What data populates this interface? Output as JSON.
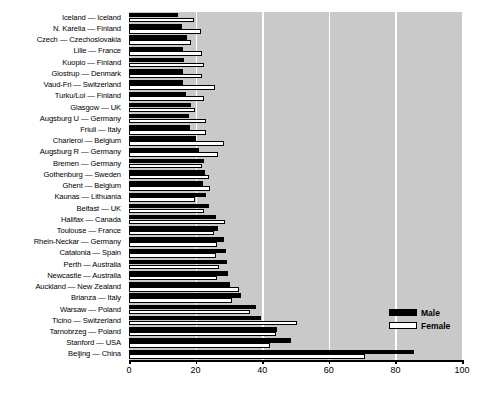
{
  "chart_data": {
    "type": "bar",
    "orientation": "horizontal",
    "title": "",
    "subtitle": "",
    "xlabel": "",
    "ylabel": "",
    "xlim": [
      0,
      100
    ],
    "xticks": [
      0,
      20,
      40,
      60,
      80,
      100
    ],
    "xtick_labels": [
      "0",
      "20",
      "40",
      "60",
      "80",
      "100"
    ],
    "grid": "vertical white gridlines at 20, 40, 60, 80, 100",
    "legend_position": "inside bottom-right",
    "plot_background": "#c9c9c9",
    "categories": [
      "Iceland — Iceland",
      "N. Karelia — Finland",
      "Czech — Czechoslovakia",
      "Lille — France",
      "Kuopio — Finland",
      "Glostrup — Denmark",
      "Vaud-Fri — Switzerland",
      "Turku/Loi — Finland",
      "Glasgow — UK",
      "Augsburg U — Germany",
      "Friuli — Italy",
      "Charleroi — Belgium",
      "Augsburg R — Germany",
      "Bremen — Germany",
      "Gothenburg — Sweden",
      "Ghent — Belgium",
      "Kaunas — Lithuania",
      "Belfast — UK",
      "Halifax — Canada",
      "Toulouse — France",
      "Rhein-Neckar — Germany",
      "Catalonia — Spain",
      "Perth — Australia",
      "Newcastle — Australia",
      "Auckland — New Zealand",
      "Brianza — Italy",
      "Warsaw — Poland",
      "Ticino — Switzerland",
      "Tarnobrzeg — Poland",
      "Stanford — USA",
      "Beijing — China"
    ],
    "series": [
      {
        "name": "Male",
        "color": "#000000",
        "values": [
          14.7,
          16.0,
          17.3,
          16.2,
          16.5,
          16.3,
          16.2,
          17.2,
          18.5,
          18.0,
          18.2,
          20.0,
          21.0,
          22.4,
          22.8,
          22.3,
          23.2,
          24.0,
          26.0,
          26.7,
          28.5,
          29.0,
          29.3,
          29.8,
          30.4,
          33.5,
          38.0,
          39.5,
          44.5,
          48.5,
          85.5
        ]
      },
      {
        "name": "Female",
        "color": "#ffffff",
        "values": [
          19.5,
          21.5,
          18.7,
          21.8,
          22.6,
          21.8,
          25.8,
          22.6,
          19.8,
          23.2,
          23.0,
          28.5,
          26.8,
          22.0,
          24.0,
          24.3,
          19.7,
          22.5,
          28.8,
          25.5,
          26.5,
          26.2,
          27.0,
          26.3,
          33.0,
          31.0,
          36.3,
          50.5,
          44.0,
          42.2,
          70.8
        ]
      }
    ]
  },
  "legend": {
    "items": [
      {
        "label": "Male",
        "swatch": "filled-black"
      },
      {
        "label": "Female",
        "swatch": "outlined-white"
      }
    ]
  },
  "caption": {
    "fragment": ""
  }
}
